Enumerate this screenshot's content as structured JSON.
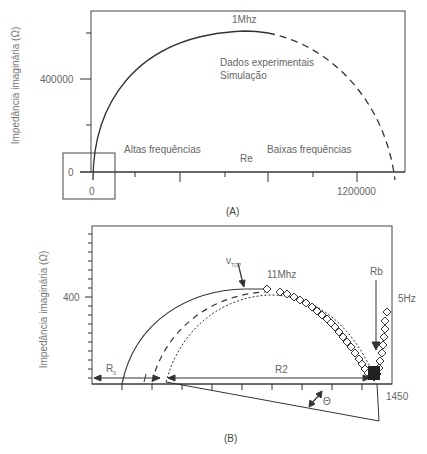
{
  "panel_a": {
    "caption": "(A)",
    "ylabel": "Impedância imaginária (Ω)",
    "xlabel": "Re",
    "y_ticks": [
      "400000",
      "0"
    ],
    "x_ticks": [
      "0",
      "1200000"
    ],
    "peak_label": "1Mhz",
    "legend": [
      "Dados experimentais",
      "Simulação"
    ],
    "region_left": "Altas frequências",
    "region_right": "Baixas frequências"
  },
  "panel_b": {
    "caption": "(B)",
    "ylabel": "Impedância imaginária (Ω)",
    "y_tick": "400",
    "x_tick": "1450",
    "vtop_label": "ν",
    "vtop_sub": "TOP",
    "high_freq_label": "11Mhz",
    "low_freq_label": "5Hz",
    "rb_label": "Rb",
    "r0_label": "R",
    "r0_sub": "0",
    "r2_label": "R2",
    "theta_label": "Θ"
  },
  "colors": {
    "line": "#333333",
    "text": "#666666",
    "frame": "#444444"
  }
}
